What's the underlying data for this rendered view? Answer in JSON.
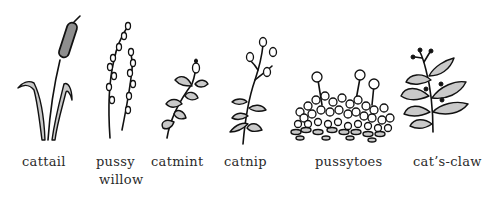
{
  "illustration": {
    "style": "hand-drawn black ink plant sketches with gray wash on white background",
    "colors": {
      "background": "#ffffff",
      "ink": "#111111",
      "wash": "#c9c9c9",
      "label_text": "#2a2a2a"
    },
    "plants": [
      {
        "id": "cattail",
        "label": "cattail"
      },
      {
        "id": "pussy-willow",
        "label": "pussy",
        "label_line2": "willow"
      },
      {
        "id": "catmint",
        "label": "catmint"
      },
      {
        "id": "catnip",
        "label": "catnip"
      },
      {
        "id": "pussytoes",
        "label": "pussytoes"
      },
      {
        "id": "cats-claw",
        "label": "cat’s-claw"
      }
    ]
  }
}
